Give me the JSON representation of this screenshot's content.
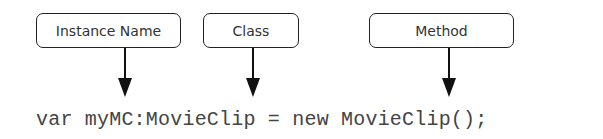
{
  "labels": {
    "instance_name": "Instance Name",
    "class": "Class",
    "method": "Method"
  },
  "code": {
    "line": "var myMC:MovieClip = new MovieClip();"
  },
  "colors": {
    "stroke": "#222222",
    "text": "#333333",
    "code_text": "#444444"
  }
}
